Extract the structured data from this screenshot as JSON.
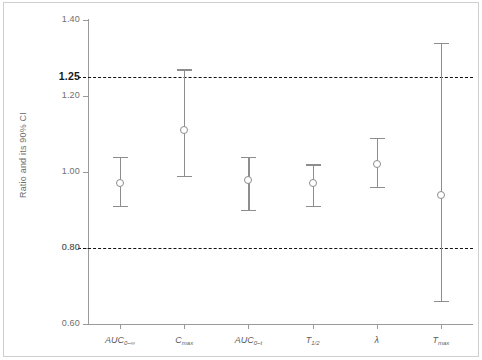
{
  "chart_data": {
    "type": "scatter",
    "title": "",
    "subtitle": "",
    "xlabel": "",
    "ylabel": "Ratio and its 90% CI",
    "ylim": [
      0.6,
      1.4
    ],
    "grid": false,
    "legend": null,
    "categories": [
      "AUC0-inf",
      "Cmax",
      "AUC0-t",
      "T1/2",
      "lambda",
      "Tmax"
    ],
    "category_labels_html": [
      "AUC<sub>0–∞</sub>",
      "C<sub>max</sub>",
      "AUC<sub>0–t</sub>",
      "T<sub>1/2</sub>",
      "λ",
      "T<sub>max</sub>"
    ],
    "y_ticks": [
      0.6,
      0.8,
      1.0,
      1.2,
      1.4
    ],
    "y_tick_labels": [
      "0.60",
      "0.80",
      "1.00",
      "1.20",
      "1.40"
    ],
    "reference_lines": [
      {
        "value": 1.25,
        "label": "1.25",
        "style": "dashed",
        "emphasis": "bold"
      },
      {
        "value": 0.8,
        "label": "0.80",
        "style": "dashed",
        "emphasis": "normal"
      }
    ],
    "series": [
      {
        "name": "Ratio and its 90% CI",
        "marker": "open-circle",
        "points": [
          {
            "category": "AUC0-inf",
            "value": 0.97,
            "ci_low": 0.91,
            "ci_high": 1.04
          },
          {
            "category": "Cmax",
            "value": 1.11,
            "ci_low": 0.99,
            "ci_high": 1.27
          },
          {
            "category": "AUC0-t",
            "value": 0.98,
            "ci_low": 0.9,
            "ci_high": 1.04
          },
          {
            "category": "T1/2",
            "value": 0.97,
            "ci_low": 0.91,
            "ci_high": 1.02
          },
          {
            "category": "lambda",
            "value": 1.02,
            "ci_low": 0.96,
            "ci_high": 1.09
          },
          {
            "category": "Tmax",
            "value": 0.94,
            "ci_low": 0.66,
            "ci_high": 1.34
          }
        ]
      }
    ],
    "colors": {
      "marker": "#8d8d8d",
      "errorbar": "#8d8d8d",
      "axis": "#9a9a9a",
      "reference_line": "#111111",
      "tick_label": "#6f6f6f",
      "frame": "#cfcfcf",
      "background": "#ffffff"
    }
  }
}
